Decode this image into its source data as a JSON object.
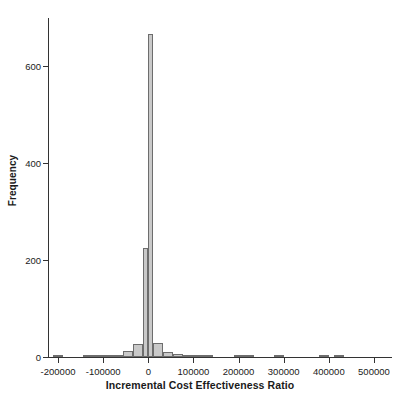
{
  "chart_data": {
    "type": "bar",
    "subtype": "histogram",
    "title": "",
    "xlabel": "Incremental Cost Effectiveness Ratio",
    "ylabel": "Frequency",
    "xlim": [
      -222222,
      540000
    ],
    "ylim": [
      0,
      700
    ],
    "grid": false,
    "legend": null,
    "bin_width": 22222,
    "xticks": [
      -200000,
      -100000,
      0,
      100000,
      200000,
      300000,
      400000,
      500000
    ],
    "xticklabels": [
      "-200000",
      "-100000",
      "0",
      "100000",
      "200000",
      "300000",
      "400000",
      "500000"
    ],
    "yticks": [
      0,
      200,
      400,
      600
    ],
    "yticklabels": [
      "0",
      "200",
      "400",
      "600"
    ],
    "bars": [
      {
        "x0": -211111,
        "x1": -188889,
        "center": -200000,
        "value": 2
      },
      {
        "x0": -188889,
        "x1": -166667,
        "center": -177778,
        "value": 0
      },
      {
        "x0": -166667,
        "x1": -144444,
        "center": -155556,
        "value": 0
      },
      {
        "x0": -144444,
        "x1": -122222,
        "center": -133333,
        "value": 1
      },
      {
        "x0": -122222,
        "x1": -100000,
        "center": -111111,
        "value": 1
      },
      {
        "x0": -100000,
        "x1": -77778,
        "center": -88889,
        "value": 4
      },
      {
        "x0": -77778,
        "x1": -55556,
        "center": -66667,
        "value": 2
      },
      {
        "x0": -55556,
        "x1": -33333,
        "center": -44444,
        "value": 12
      },
      {
        "x0": -33333,
        "x1": -11111,
        "center": -22222,
        "value": 27
      },
      {
        "x0": -11111,
        "x1": 0,
        "center": -5556,
        "value": 225
      },
      {
        "x0": 0,
        "x1": 11111,
        "center": 5556,
        "value": 668
      },
      {
        "x0": 11111,
        "x1": 33333,
        "center": 22222,
        "value": 28
      },
      {
        "x0": 33333,
        "x1": 55556,
        "center": 44444,
        "value": 10
      },
      {
        "x0": 55556,
        "x1": 77778,
        "center": 66667,
        "value": 7
      },
      {
        "x0": 77778,
        "x1": 100000,
        "center": 88889,
        "value": 3
      },
      {
        "x0": 100000,
        "x1": 122222,
        "center": 111111,
        "value": 1
      },
      {
        "x0": 122222,
        "x1": 144444,
        "center": 133333,
        "value": 1
      },
      {
        "x0": 188889,
        "x1": 211111,
        "center": 200000,
        "value": 1
      },
      {
        "x0": 211111,
        "x1": 233333,
        "center": 222222,
        "value": 1
      },
      {
        "x0": 277778,
        "x1": 300000,
        "center": 288889,
        "value": 1
      },
      {
        "x0": 377778,
        "x1": 400000,
        "center": 388889,
        "value": 1
      },
      {
        "x0": 411111,
        "x1": 433333,
        "center": 422222,
        "value": 1
      }
    ],
    "colors": {
      "bar_fill": "#c9c9c9",
      "bar_edge": "#6d6d6d",
      "axis": "#333333",
      "text": "#1a1a1a",
      "background": "#ffffff"
    }
  }
}
